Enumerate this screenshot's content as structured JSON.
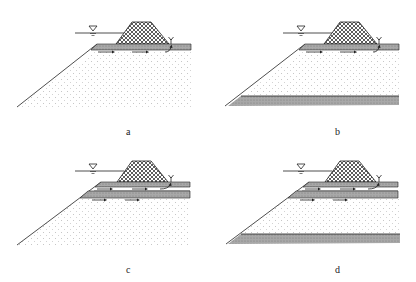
{
  "figure": {
    "panels": [
      {
        "id": "a",
        "label": "a",
        "layers": [
          "surface permeable layer"
        ],
        "bottom_layer": false,
        "double_layer": false
      },
      {
        "id": "b",
        "label": "b",
        "layers": [
          "surface permeable layer",
          "bottom impermeable layer"
        ],
        "bottom_layer": true,
        "double_layer": false
      },
      {
        "id": "c",
        "label": "c",
        "layers": [
          "two permeable layers"
        ],
        "bottom_layer": false,
        "double_layer": true
      },
      {
        "id": "d",
        "label": "d",
        "layers": [
          "two permeable layers",
          "bottom impermeable layer"
        ],
        "bottom_layer": true,
        "double_layer": true
      }
    ],
    "elements": {
      "water_level_symbol": "inverted-triangle",
      "dam": "cross-hatched trapezoid embankment",
      "seepage_arrows": "right-pointing arrows",
      "seepage_exit": "boil / spring at dam toe"
    },
    "colors": {
      "line": "#222222",
      "band": "#9a9a9a",
      "sand_dots": "#bbbbbb",
      "hatch": "#333333"
    }
  }
}
